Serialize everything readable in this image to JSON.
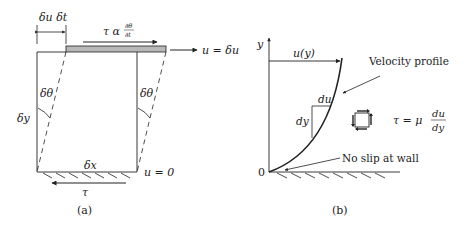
{
  "panel_a": {
    "caption": "(a)",
    "label_displacement": "δu δt",
    "label_shear_rate": "τ α",
    "label_dtheta_num": "∂θ",
    "label_dtheta_den": "∂t",
    "label_top_velocity": "u = δu",
    "label_angle_left": "δθ",
    "label_angle_right": "δθ",
    "label_height": "δy",
    "label_width": "δx",
    "label_bottom_velocity": "u = 0",
    "label_wall_shear": "τ"
  },
  "panel_b": {
    "caption": "(b)",
    "axis_y": "y",
    "axis_origin": "0",
    "label_velocity": "u(y)",
    "label_profile": "Velocity profile",
    "label_du": "du",
    "label_dy": "dy",
    "label_no_slip": "No slip at wall",
    "equation_lhs": "τ = μ",
    "equation_num": "du",
    "equation_den": "dy"
  },
  "colors": {
    "ink": "#222222",
    "plate_fill": "#b8b8b8",
    "background": "#ffffff"
  }
}
